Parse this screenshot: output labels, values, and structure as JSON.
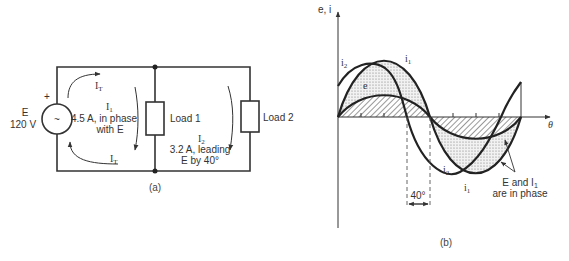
{
  "circuit": {
    "source": {
      "symbol": "~",
      "plus": "+",
      "name": "E",
      "value": "120 V"
    },
    "loads": [
      {
        "label": "Load 1"
      },
      {
        "label": "Load 2"
      }
    ],
    "currents": {
      "it_top": "I",
      "it_top_sub": "T",
      "it_bottom": "I",
      "it_bottom_sub": "T",
      "i1_name": "I",
      "i1_sub": "1",
      "i1_line1": "4.5 A, in phase",
      "i1_line2": "with E",
      "i2_name": "I",
      "i2_sub": "2",
      "i2_line1": "3.2 A, leading",
      "i2_line2": "E by 40°"
    },
    "caption": "(a)"
  },
  "waveform": {
    "y_axis_label": "e, i",
    "x_axis_label": "θ",
    "curve_labels": {
      "i2_top": "i",
      "i2_top_sub": "2",
      "i1_top": "i",
      "i1_top_sub": "1",
      "e": "e",
      "i2_bottom": "i",
      "i2_bottom_sub": "2",
      "i1_bottom": "i",
      "i1_bottom_sub": "1"
    },
    "phase_angle": "40°",
    "annotation_line1": "E and I",
    "annotation_sub": "1",
    "annotation_line2": "are in phase",
    "caption": "(b)"
  }
}
